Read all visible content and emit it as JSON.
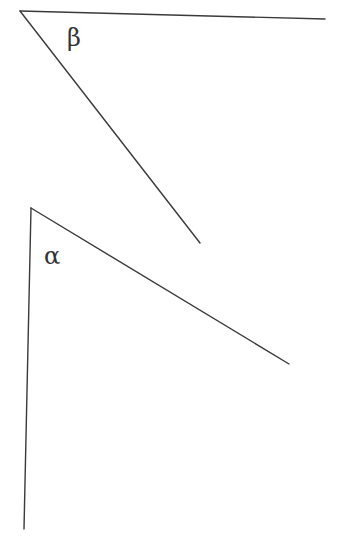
{
  "angles": [
    {
      "id": "beta",
      "label": "β"
    },
    {
      "id": "alpha",
      "label": "α"
    }
  ],
  "colors": {
    "line": "#3a3a3a",
    "text": "#333333",
    "background": "#ffffff"
  }
}
